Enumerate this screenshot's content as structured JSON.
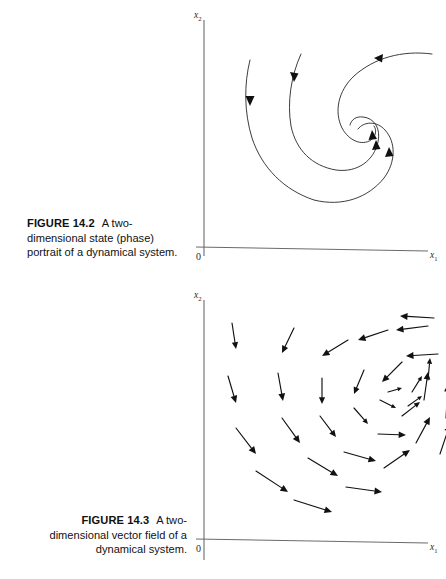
{
  "page": {
    "background_color": "#ffffff",
    "text_color": "#111111"
  },
  "figures": [
    {
      "id": "figure-14-2",
      "label": "FIGURE 14.2",
      "caption_text": "A two-dimensional state (phase) portrait of a dynamical system.",
      "axes": {
        "x_label": "x",
        "x_subscript": "1",
        "y_label": "x",
        "y_subscript": "2",
        "origin_label": "0"
      },
      "chart_data": {
        "type": "line",
        "title": "A two-dimensional state (phase) portrait of a dynamical system.",
        "xlabel": "x1",
        "ylabel": "x2",
        "grid": false,
        "legend": "none",
        "description": "Phase portrait: three spiral trajectories converging clockwise inward to a stable focus.",
        "series": [
          {
            "name": "trajectory-outer",
            "arrow_direction": "inward",
            "points": [
              [
                62,
                52
              ],
              [
                60,
                84
              ],
              [
                64,
                118
              ],
              [
                76,
                150
              ],
              [
                96,
                176
              ],
              [
                124,
                193
              ],
              [
                154,
                196
              ],
              [
                180,
                186
              ],
              [
                197,
                167
              ],
              [
                203,
                144
              ],
              [
                197,
                126
              ],
              [
                184,
                117
              ],
              [
                172,
                121
              ]
            ]
          },
          {
            "name": "trajectory-middle",
            "arrow_direction": "inward",
            "points": [
              [
                113,
                46
              ],
              [
                104,
                74
              ],
              [
                102,
                104
              ],
              [
                110,
                132
              ],
              [
                128,
                152
              ],
              [
                152,
                160
              ],
              [
                174,
                153
              ],
              [
                186,
                136
              ],
              [
                186,
                120
              ],
              [
                176,
                111
              ],
              [
                166,
                115
              ]
            ]
          },
          {
            "name": "trajectory-inner",
            "arrow_direction": "inward",
            "points": [
              [
                243,
                47
              ],
              [
                210,
                47
              ],
              [
                181,
                57
              ],
              [
                160,
                76
              ],
              [
                152,
                100
              ],
              [
                158,
                120
              ],
              [
                172,
                130
              ],
              [
                182,
                127
              ]
            ]
          }
        ],
        "arrow_markers": [
          {
            "x": 62,
            "y": 92,
            "angle": 96
          },
          {
            "x": 107,
            "y": 68,
            "angle": 106
          },
          {
            "x": 190,
            "y": 52,
            "angle": 186
          },
          {
            "x": 183,
            "y": 128,
            "angle": 285
          },
          {
            "x": 186,
            "y": 138,
            "angle": 285
          },
          {
            "x": 199,
            "y": 145,
            "angle": 282
          }
        ]
      }
    },
    {
      "id": "figure-14-3",
      "label": "FIGURE 14.3",
      "caption_text": "A two-dimensional vector field of a dynamical system.",
      "axes": {
        "x_label": "x",
        "x_subscript": "1",
        "y_label": "x",
        "y_subscript": "2",
        "origin_label": "0"
      },
      "chart_data": {
        "type": "scatter",
        "title": "A two-dimensional vector field of a dynamical system.",
        "xlabel": "x1",
        "ylabel": "x2",
        "grid": false,
        "legend": "none",
        "description": "Vector field of a stable spiral: arrows circulate clockwise while pointing inward toward the focus.",
        "vectors": [
          {
            "x": 44,
            "y": 35,
            "dx": 4,
            "dy": 26
          },
          {
            "x": 40,
            "y": 88,
            "dx": 8,
            "dy": 27
          },
          {
            "x": 48,
            "y": 140,
            "dx": 20,
            "dy": 26
          },
          {
            "x": 68,
            "y": 183,
            "dx": 32,
            "dy": 21
          },
          {
            "x": 106,
            "y": 212,
            "dx": 38,
            "dy": 12
          },
          {
            "x": 106,
            "y": 40,
            "dx": -12,
            "dy": 25
          },
          {
            "x": 90,
            "y": 85,
            "dx": 5,
            "dy": 28
          },
          {
            "x": 94,
            "y": 130,
            "dx": 18,
            "dy": 25
          },
          {
            "x": 120,
            "y": 170,
            "dx": 30,
            "dy": 18
          },
          {
            "x": 158,
            "y": 199,
            "dx": 36,
            "dy": 5
          },
          {
            "x": 160,
            "y": 52,
            "dx": -26,
            "dy": 16
          },
          {
            "x": 134,
            "y": 90,
            "dx": 0,
            "dy": 26
          },
          {
            "x": 132,
            "y": 128,
            "dx": 16,
            "dy": 21
          },
          {
            "x": 156,
            "y": 164,
            "dx": 32,
            "dy": 9
          },
          {
            "x": 196,
            "y": 180,
            "dx": 26,
            "dy": -18
          },
          {
            "x": 200,
            "y": 42,
            "dx": -30,
            "dy": 10
          },
          {
            "x": 176,
            "y": 82,
            "dx": -10,
            "dy": 24
          },
          {
            "x": 166,
            "y": 120,
            "dx": 14,
            "dy": 16
          },
          {
            "x": 190,
            "y": 146,
            "dx": 28,
            "dy": 1
          },
          {
            "x": 228,
            "y": 155,
            "dx": 14,
            "dy": -26
          },
          {
            "x": 240,
            "y": 38,
            "dx": -32,
            "dy": 4
          },
          {
            "x": 214,
            "y": 74,
            "dx": -20,
            "dy": 20
          },
          {
            "x": 192,
            "y": 112,
            "dx": 16,
            "dy": 8
          },
          {
            "x": 214,
            "y": 128,
            "dx": 18,
            "dy": -14
          },
          {
            "x": 236,
            "y": 112,
            "dx": 4,
            "dy": -28
          },
          {
            "x": 246,
            "y": 30,
            "dx": -34,
            "dy": -2
          },
          {
            "x": 250,
            "y": 66,
            "dx": -32,
            "dy": 2
          },
          {
            "x": 224,
            "y": 104,
            "dx": 10,
            "dy": -16
          },
          {
            "x": 240,
            "y": 92,
            "dx": 2,
            "dy": -22
          },
          {
            "x": 220,
            "y": 118,
            "dx": 14,
            "dy": -10
          },
          {
            "x": 200,
            "y": 104,
            "dx": 14,
            "dy": -4
          },
          {
            "x": 258,
            "y": 130,
            "dx": 2,
            "dy": -34
          },
          {
            "x": 252,
            "y": 166,
            "dx": 10,
            "dy": -30
          }
        ]
      }
    }
  ]
}
